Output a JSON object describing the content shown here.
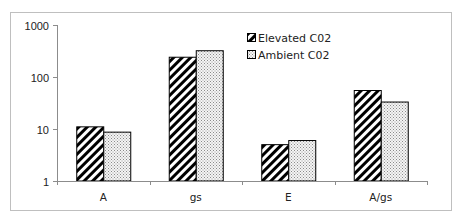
{
  "chart_data": {
    "type": "bar",
    "title": "",
    "xlabel": "",
    "ylabel": "",
    "yscale": "log",
    "ylim": [
      1,
      1000
    ],
    "yticks": [
      "1",
      "10",
      "100",
      "1000"
    ],
    "grid": false,
    "legend_position": "upper-center-right",
    "categories": [
      "A",
      "gs",
      "E",
      "A/gs"
    ],
    "series": [
      {
        "name": "Elevated C02",
        "pattern": "diagonal-stripes",
        "values": [
          11,
          240,
          5,
          55
        ]
      },
      {
        "name": "Ambient C02",
        "pattern": "dotted",
        "values": [
          8.7,
          320,
          6,
          33
        ]
      }
    ]
  },
  "colors": {
    "frame": "#bfbfbf",
    "axis": "#8c8c8c",
    "bar_edge": "#000000",
    "stripe": "#000000",
    "dot": "#8a8a8a"
  }
}
